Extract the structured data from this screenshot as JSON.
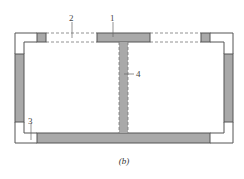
{
  "diagram": {
    "caption": "(b)",
    "labels": {
      "l1": "1",
      "l2": "2",
      "l3": "3",
      "l4": "4"
    },
    "colors": {
      "line": "#555555",
      "fill": "#a9a9a9",
      "background": "#ffffff"
    }
  }
}
